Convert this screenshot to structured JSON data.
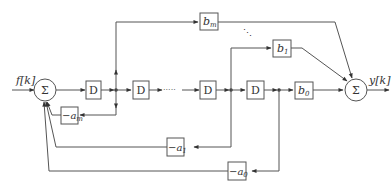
{
  "diagram": {
    "type": "block-diagram",
    "input_label": "f[k]",
    "output_label": "y[k]",
    "summers": [
      {
        "id": "sum-input",
        "symbol": "Σ"
      },
      {
        "id": "sum-output",
        "symbol": "Σ"
      }
    ],
    "delays": [
      {
        "id": "delay-1",
        "label": "D"
      },
      {
        "id": "delay-2",
        "label": "D"
      },
      {
        "id": "delay-3",
        "label": "D"
      },
      {
        "id": "delay-4",
        "label": "D"
      }
    ],
    "ellipsis": "·····",
    "vertical_ellipsis": "⋱",
    "feedforward": [
      {
        "id": "bm",
        "base": "b",
        "sub": "m"
      },
      {
        "id": "b1",
        "base": "b",
        "sub": "1"
      },
      {
        "id": "b0",
        "base": "b",
        "sub": "0"
      }
    ],
    "feedback": [
      {
        "id": "am",
        "prefix": "−",
        "base": "a",
        "sub": "m"
      },
      {
        "id": "a1",
        "prefix": "−",
        "base": "a",
        "sub": "1"
      },
      {
        "id": "a0",
        "prefix": "−",
        "base": "a",
        "sub": "0"
      }
    ]
  }
}
